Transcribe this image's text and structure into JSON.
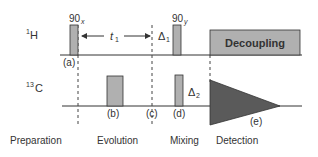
{
  "diagram": {
    "channels": {
      "h": {
        "label_sup": "1",
        "label": "H"
      },
      "c": {
        "label_sup": "13",
        "label": "C"
      }
    },
    "pulses": {
      "p90x": {
        "label": "90",
        "sub": "x"
      },
      "p90y": {
        "label": "90",
        "sub": "y"
      }
    },
    "delays": {
      "t1": {
        "label": "t",
        "sub": "1"
      },
      "d1": {
        "label": "Δ",
        "sub": "1"
      },
      "d2": {
        "label": "Δ",
        "sub": "2"
      }
    },
    "decoupling_label": "Decoupling",
    "markers": [
      "(a)",
      "(b)",
      "(c)",
      "(d)",
      "(e)"
    ],
    "periods": [
      "Preparation",
      "Evolution",
      "Mixing",
      "Detection"
    ],
    "colors": {
      "pulse_fill": "#b0b0b0",
      "fid_fill": "#5a5a5a",
      "line": "#333333"
    }
  }
}
